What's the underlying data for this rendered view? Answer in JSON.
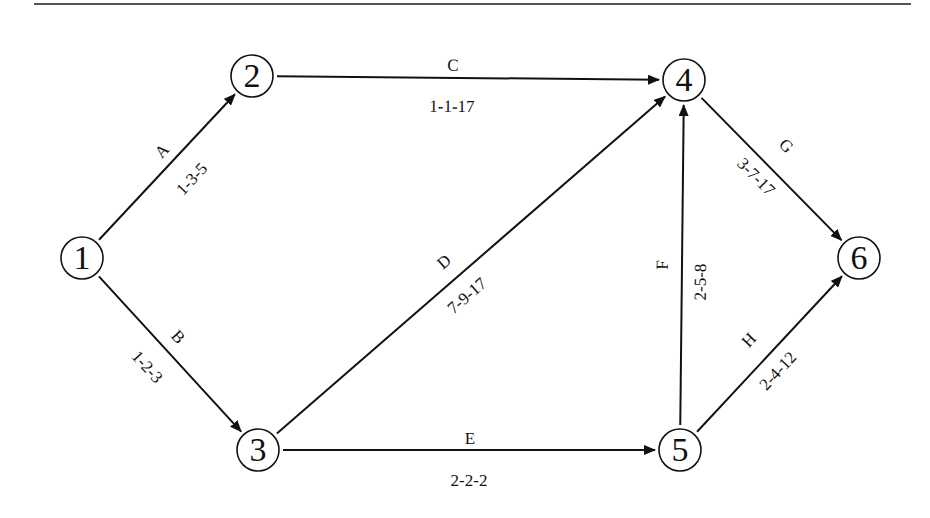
{
  "diagram": {
    "type": "activity-on-arrow network",
    "top_rule": {
      "x1": 34,
      "x2": 911,
      "y": 4,
      "color": "#555555",
      "width": 2
    },
    "colors": {
      "stroke": "#111111",
      "text": "#111111",
      "background": "#ffffff"
    },
    "nodes": [
      {
        "id": "1",
        "label": "1",
        "x": 82,
        "y": 258,
        "r": 21
      },
      {
        "id": "2",
        "label": "2",
        "x": 252,
        "y": 76,
        "r": 21
      },
      {
        "id": "3",
        "label": "3",
        "x": 258,
        "y": 450,
        "r": 21
      },
      {
        "id": "4",
        "label": "4",
        "x": 684,
        "y": 80,
        "r": 21
      },
      {
        "id": "5",
        "label": "5",
        "x": 680,
        "y": 450,
        "r": 21
      },
      {
        "id": "6",
        "label": "6",
        "x": 859,
        "y": 258,
        "r": 21
      }
    ],
    "edges": [
      {
        "id": "A",
        "name": "A",
        "from": "1",
        "to": "2",
        "durations": "1-3-5",
        "name_pos": {
          "x": 163,
          "y": 152
        },
        "dur_pos": {
          "x": 193,
          "y": 180
        }
      },
      {
        "id": "B",
        "name": "B",
        "from": "1",
        "to": "3",
        "durations": "1-2-3",
        "name_pos": {
          "x": 177,
          "y": 338
        },
        "dur_pos": {
          "x": 146,
          "y": 368
        }
      },
      {
        "id": "C",
        "name": "C",
        "from": "2",
        "to": "4",
        "durations": "1-1-17",
        "name_pos": {
          "x": 453,
          "y": 67
        },
        "dur_pos": {
          "x": 452,
          "y": 108
        }
      },
      {
        "id": "D",
        "name": "D",
        "from": "3",
        "to": "4",
        "durations": "7-9-17",
        "name_pos": {
          "x": 445,
          "y": 263
        },
        "dur_pos": {
          "x": 468,
          "y": 297
        }
      },
      {
        "id": "E",
        "name": "E",
        "from": "3",
        "to": "5",
        "durations": "2-2-2",
        "name_pos": {
          "x": 470,
          "y": 440
        },
        "dur_pos": {
          "x": 469,
          "y": 482
        }
      },
      {
        "id": "F",
        "name": "F",
        "from": "5",
        "to": "4",
        "durations": "2-5-8",
        "name_pos": {
          "x": 664,
          "y": 265
        },
        "dur_pos": {
          "x": 702,
          "y": 282
        }
      },
      {
        "id": "G",
        "name": "G",
        "from": "4",
        "to": "6",
        "durations": "3-7-17",
        "name_pos": {
          "x": 785,
          "y": 147
        },
        "dur_pos": {
          "x": 755,
          "y": 178
        }
      },
      {
        "id": "H",
        "name": "H",
        "from": "5",
        "to": "6",
        "durations": "2-4-12",
        "name_pos": {
          "x": 750,
          "y": 341
        },
        "dur_pos": {
          "x": 779,
          "y": 372
        }
      }
    ]
  }
}
